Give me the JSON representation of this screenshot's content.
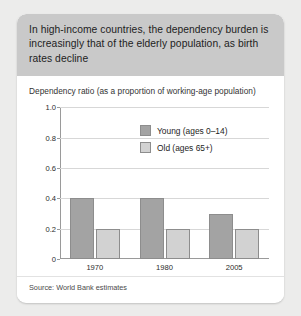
{
  "card": {
    "title": "In high-income countries, the dependency burden is increasingly that of the elderly population, as birth rates decline",
    "source": "Source: World Bank estimates"
  },
  "chart_data": {
    "type": "bar",
    "title": "Dependency ratio (as a proportion of working-age population)",
    "subtitle": "",
    "xlabel": "",
    "ylabel": "",
    "categories": [
      "1970",
      "1980",
      "2005"
    ],
    "series": [
      {
        "name": "Young (ages 0–14)",
        "values": [
          0.4,
          0.4,
          0.3
        ],
        "color": "#a3a3a3"
      },
      {
        "name": "Old (ages 65+)",
        "values": [
          0.2,
          0.2,
          0.2
        ],
        "color": "#d2d2d2"
      }
    ],
    "ylim": [
      0,
      1.0
    ],
    "yticks": [
      "0",
      "0.2",
      "0.4",
      "0.6",
      "0.8",
      "1.0"
    ],
    "ytick_values": [
      0,
      0.2,
      0.4,
      0.6,
      0.8,
      1.0
    ],
    "grid": true,
    "legend_position": "inside-upper-right",
    "source": "Source: World Bank estimates"
  }
}
